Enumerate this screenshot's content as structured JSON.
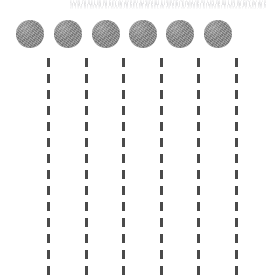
{
  "canvas": {
    "width": 275,
    "height": 279,
    "background_color": "#ffffff"
  },
  "artifact": {
    "name": "faint-scan-noise-strip",
    "description": "illegible light-gray scanned text artifact",
    "x": 70,
    "y": 0,
    "width": 196,
    "height": 9,
    "color": "#9a9aa0"
  },
  "diagram": {
    "type": "schematic",
    "circle_count": 6,
    "line_count": 6,
    "circle_color": "#8a8a8a",
    "line_color": "#4a4a4a",
    "circle_diameter": 28,
    "circle_center_y": 34,
    "line_width": 3,
    "dash_length": 9,
    "dash_gap": 7,
    "line_top": 58,
    "line_bottom": 279,
    "circles": [
      {
        "label": "circle-1",
        "cx": 30,
        "cy": 34,
        "r": 14
      },
      {
        "label": "circle-2",
        "cx": 68,
        "cy": 34,
        "r": 14
      },
      {
        "label": "circle-3",
        "cx": 106,
        "cy": 34,
        "r": 14
      },
      {
        "label": "circle-4",
        "cx": 143,
        "cy": 34,
        "r": 14
      },
      {
        "label": "circle-5",
        "cx": 180,
        "cy": 34,
        "r": 14
      },
      {
        "label": "circle-6",
        "cx": 218,
        "cy": 34,
        "r": 14
      }
    ],
    "dashed_lines": [
      {
        "label": "dashed-line-1",
        "x": 47
      },
      {
        "label": "dashed-line-2",
        "x": 85
      },
      {
        "label": "dashed-line-3",
        "x": 122
      },
      {
        "label": "dashed-line-4",
        "x": 160
      },
      {
        "label": "dashed-line-5",
        "x": 197
      },
      {
        "label": "dashed-line-6",
        "x": 235
      }
    ]
  }
}
